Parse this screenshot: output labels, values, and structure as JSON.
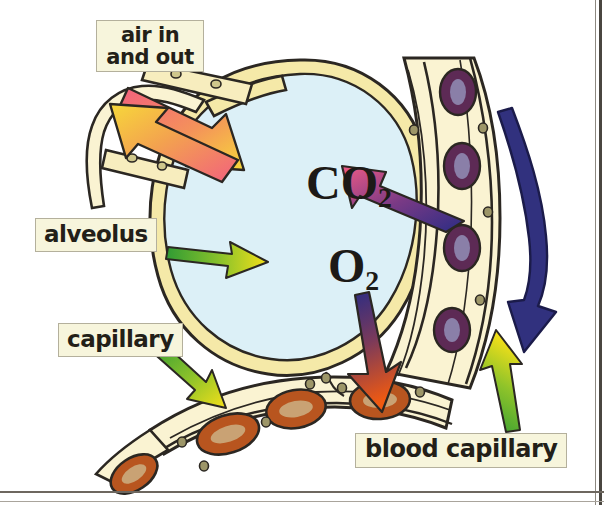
{
  "diagram": {
    "labels": {
      "air_in_and_out": "air in\nand out",
      "alveolus": "alveolus",
      "capillary": "capillary",
      "blood_capillary": "blood capillary"
    },
    "gases": {
      "carbon_dioxide_symbol": "CO",
      "carbon_dioxide_subscript": "2",
      "oxygen_symbol": "O",
      "oxygen_subscript": "2"
    },
    "colors": {
      "alveolus_interior": "#dcf0f7",
      "tissue_wall": "#f5e9a8",
      "tissue_wall_light": "#faf3d2",
      "wall_outline": "#2b2722",
      "label_box_fill": "#f7f5dc",
      "label_box_border": "#b4b09c",
      "label_text": "#231f18",
      "pointer_arrow_green": "#3ea33a",
      "pointer_arrow_yellow": "#f5e019",
      "airflow_pink": "#f0617f",
      "airflow_yellow": "#f7d83a",
      "co2_arrow_start": "#2e2f86",
      "co2_arrow_end": "#e8527f",
      "o2_arrow_start": "#2e2f86",
      "o2_arrow_end": "#ef5a16",
      "blood_flow_arrow": "#31317e",
      "red_blood_cell_ring": "#b8551f",
      "red_blood_cell_center": "#c9a274",
      "endothelial_nucleus_ring": "#5d2a55",
      "endothelial_nucleus_center": "#8a7fa8",
      "page_frame": "#4a4640"
    },
    "arrows": [
      {
        "name": "air-in-arrow",
        "direction": "into-alveolus",
        "gradient": "pink-to-yellow"
      },
      {
        "name": "air-out-arrow",
        "direction": "out-of-alveolus",
        "gradient": "pink-to-yellow"
      },
      {
        "name": "co2-diffusion-arrow",
        "direction": "blood-to-alveolus",
        "gradient": "blue-to-pink"
      },
      {
        "name": "o2-diffusion-arrow",
        "direction": "alveolus-to-blood",
        "gradient": "blue-to-orange"
      },
      {
        "name": "blood-flow-arrow",
        "direction": "downward",
        "color": "navy"
      }
    ],
    "cell_counts": {
      "red_blood_cells": 4,
      "endothelial_nuclei": 4
    }
  }
}
